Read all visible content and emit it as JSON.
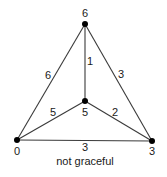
{
  "diagram": {
    "caption": "not graceful",
    "vertices": [
      {
        "id": "top",
        "label": "6",
        "x": 85,
        "y": 24
      },
      {
        "id": "center",
        "label": "5",
        "x": 85,
        "y": 101
      },
      {
        "id": "bottom-left",
        "label": "0",
        "x": 17,
        "y": 140
      },
      {
        "id": "bottom-right",
        "label": "3",
        "x": 152,
        "y": 141
      }
    ],
    "edges": [
      {
        "from": "top",
        "to": "center",
        "label": "1"
      },
      {
        "from": "top",
        "to": "bottom-left",
        "label": "6"
      },
      {
        "from": "top",
        "to": "bottom-right",
        "label": "3"
      },
      {
        "from": "center",
        "to": "bottom-left",
        "label": "5"
      },
      {
        "from": "center",
        "to": "bottom-right",
        "label": "2"
      },
      {
        "from": "bottom-left",
        "to": "bottom-right",
        "label": "3"
      }
    ],
    "colors": {
      "line": "#3a3a3a",
      "node": "#000000",
      "text": "#1a1a1a"
    }
  }
}
